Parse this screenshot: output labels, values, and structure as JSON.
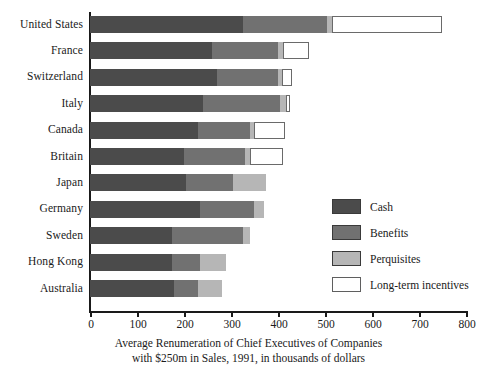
{
  "chart_data": {
    "type": "bar",
    "orientation": "horizontal",
    "stacked": true,
    "title": "",
    "caption_lines": [
      "Average Renumeration of Chief Executives of Companies",
      "with $250m in Sales, 1991, in thousands of dollars"
    ],
    "xlabel": "",
    "ylabel": "",
    "xlim": [
      0,
      800
    ],
    "xticks": [
      0,
      100,
      200,
      300,
      400,
      500,
      600,
      700,
      800
    ],
    "xtick_labels": [
      "0",
      "100",
      "200",
      "300",
      "400",
      "500",
      "600",
      "700",
      "800"
    ],
    "grid": false,
    "legend_position": "inside-right",
    "categories": [
      "United States",
      "France",
      "Switzerland",
      "Italy",
      "Canada",
      "Britain",
      "Japan",
      "Germany",
      "Sweden",
      "Hong Kong",
      "Australia"
    ],
    "series": [
      {
        "name": "Cash",
        "color": "#4b4b4b",
        "values": [
          325,
          260,
          270,
          240,
          230,
          200,
          205,
          235,
          175,
          175,
          178
        ]
      },
      {
        "name": "Benefits",
        "color": "#717171",
        "values": [
          180,
          140,
          130,
          165,
          110,
          130,
          100,
          115,
          150,
          60,
          52
        ]
      },
      {
        "name": "Perquisites",
        "color": "#b6b6b6",
        "values": [
          10,
          10,
          8,
          12,
          10,
          10,
          70,
          20,
          15,
          55,
          50
        ]
      },
      {
        "name": "Long-term incentives",
        "color": "#ffffff",
        "values": [
          235,
          55,
          22,
          8,
          65,
          70,
          0,
          0,
          0,
          0,
          0
        ]
      }
    ],
    "totals": [
      750,
      465,
      430,
      425,
      415,
      410,
      375,
      370,
      340,
      290,
      280
    ]
  },
  "legend": {
    "items": [
      {
        "label": "Cash",
        "color": "#4b4b4b",
        "swatch": "filled"
      },
      {
        "label": "Benefits",
        "color": "#717171",
        "swatch": "filled"
      },
      {
        "label": "Perquisites",
        "color": "#b6b6b6",
        "swatch": "filled"
      },
      {
        "label": "Long-term incentives",
        "color": "#ffffff",
        "swatch": "outlined"
      }
    ]
  },
  "colors": {
    "cash": "#4b4b4b",
    "benefits": "#717171",
    "perquisites": "#b6b6b6",
    "long_term_incentives": "#ffffff",
    "axis": "#1a1a1a",
    "background": "#ffffff"
  }
}
